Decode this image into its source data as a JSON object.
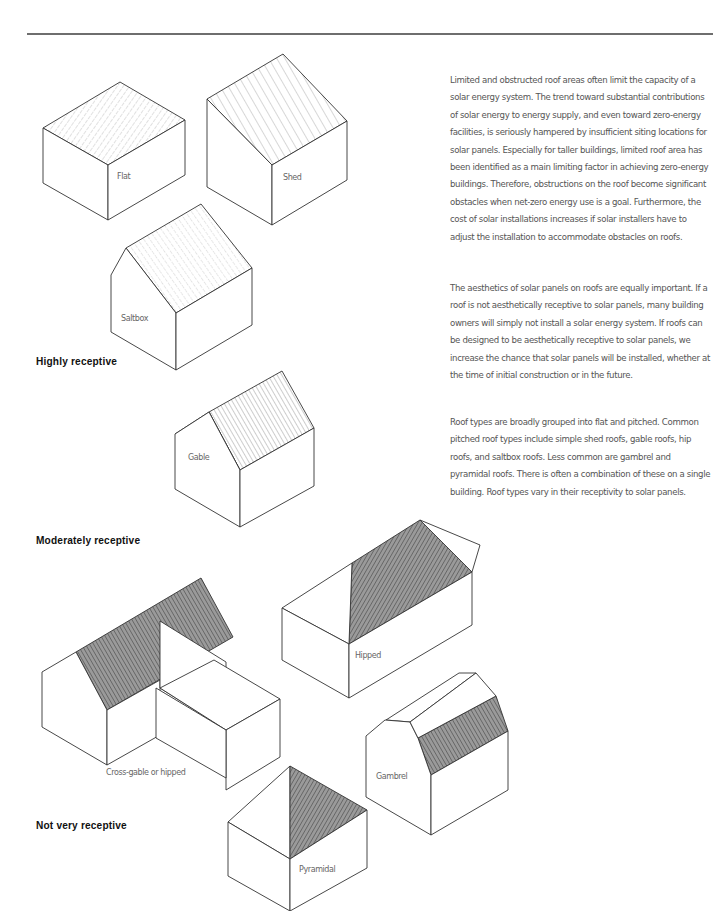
{
  "page": {
    "paragraphs": [
      "Limited and obstructed roof areas often limit the capacity of a solar energy system. The trend toward substantial contributions of solar energy to energy supply, and even toward zero-energy facilities, is seriously hampered by insufficient siting locations for solar panels. Especially for taller buildings, limited roof area has been identified as a main limiting factor in achieving zero-energy buildings. Therefore, obstructions on the roof become significant obstacles when net-zero energy use is a goal. Furthermore, the cost of solar installations increases if solar installers have to adjust the installation to accommodate obstacles on roofs.",
      "The aesthetics of solar panels on roofs are equally important. If a roof is not aesthetically receptive to solar panels, many building owners will simply not install a solar energy system. If roofs can be designed to be aesthetically receptive to solar panels, we increase the chance that solar panels will be installed, whether at the time of initial construction or in the future.",
      "Roof types are broadly grouped into flat and pitched. Common pitched roof types include simple shed roofs, gable roofs, hip roofs, and saltbox roofs. Less common are gambrel and pyramidal roofs. There is often a combination of these on a single building. Roof types vary in their receptivity to solar panels."
    ]
  },
  "categories": {
    "high": "Highly receptive",
    "moderate": "Moderately receptive",
    "low": "Not very receptive"
  },
  "roofs": {
    "flat": "Flat",
    "shed": "Shed",
    "saltbox": "Saltbox",
    "gable": "Gable",
    "cross_gable": "Cross-gable or hipped",
    "hipped": "Hipped",
    "gambrel": "Gambrel",
    "pyramidal": "Pyramidal"
  },
  "colors": {
    "rule": "#6e6e6e",
    "outline": "#333333",
    "shaded_roof": "#8a8a8a",
    "text": "#555555",
    "heading": "#111111"
  }
}
